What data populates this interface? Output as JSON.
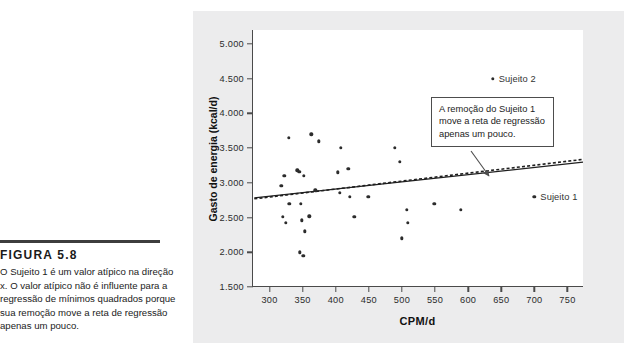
{
  "figure": {
    "label": "FIGURA 5.8",
    "caption": "O Sujeito 1 é um valor atípico na direção x. O valor atípico não é influente para a regressão de mínimos quadrados porque sua remoção move a reta de regressão apenas um pouco."
  },
  "annotation": {
    "text": "A remoção do Sujeito 1 move a reta de regressão apenas um pouco."
  },
  "chart_data": {
    "type": "scatter",
    "title": "",
    "xlabel": "CPM/d",
    "ylabel": "Gasto de energia (kcal/d)",
    "xlim": [
      275,
      775
    ],
    "ylim": [
      1500,
      5200
    ],
    "xticks": [
      300,
      350,
      400,
      450,
      500,
      550,
      600,
      650,
      700,
      750
    ],
    "xtick_labels": [
      "300",
      "350",
      "400",
      "450",
      "500",
      "550",
      "600",
      "650",
      "700",
      "750"
    ],
    "yticks": [
      1500,
      2000,
      2500,
      3000,
      3500,
      4000,
      4500,
      5000
    ],
    "ytick_labels": [
      "1.500",
      "2.000",
      "2.500",
      "3.000",
      "3.500",
      "4.000",
      "4.500",
      "5.000"
    ],
    "grid": false,
    "legend": false,
    "points": [
      {
        "x": 318,
        "y": 2960
      },
      {
        "x": 320,
        "y": 2510
      },
      {
        "x": 322,
        "y": 3100
      },
      {
        "x": 325,
        "y": 2420
      },
      {
        "x": 329,
        "y": 3650
      },
      {
        "x": 330,
        "y": 2700
      },
      {
        "x": 342,
        "y": 3180
      },
      {
        "x": 345,
        "y": 3160
      },
      {
        "x": 346,
        "y": 2000
      },
      {
        "x": 347,
        "y": 2700
      },
      {
        "x": 349,
        "y": 2460
      },
      {
        "x": 351,
        "y": 1950
      },
      {
        "x": 352,
        "y": 3100
      },
      {
        "x": 353,
        "y": 2300
      },
      {
        "x": 360,
        "y": 2520
      },
      {
        "x": 363,
        "y": 3700
      },
      {
        "x": 369,
        "y": 2890
      },
      {
        "x": 374,
        "y": 3600
      },
      {
        "x": 403,
        "y": 3150
      },
      {
        "x": 406,
        "y": 2860
      },
      {
        "x": 408,
        "y": 3500
      },
      {
        "x": 419,
        "y": 3200
      },
      {
        "x": 421,
        "y": 2800
      },
      {
        "x": 428,
        "y": 2510
      },
      {
        "x": 449,
        "y": 2800
      },
      {
        "x": 489,
        "y": 3500
      },
      {
        "x": 497,
        "y": 3300
      },
      {
        "x": 500,
        "y": 2200
      },
      {
        "x": 507,
        "y": 2610
      },
      {
        "x": 509,
        "y": 2420
      },
      {
        "x": 549,
        "y": 2700
      },
      {
        "x": 589,
        "y": 2610
      }
    ],
    "highlighted_points": [
      {
        "label": "Sujeito 2",
        "x": 637,
        "y": 4500
      },
      {
        "label": "Sujeito 1",
        "x": 700,
        "y": 2800
      }
    ],
    "lines": [
      {
        "name": "reta de regressão (todos os dados)",
        "style": "solid",
        "x0": 277,
        "y0": 2775,
        "x1": 775,
        "y1": 3290
      },
      {
        "name": "reta de regressão (sem Sujeito 1)",
        "style": "dashed",
        "x0": 277,
        "y0": 2760,
        "x1": 775,
        "y1": 3330
      }
    ]
  }
}
